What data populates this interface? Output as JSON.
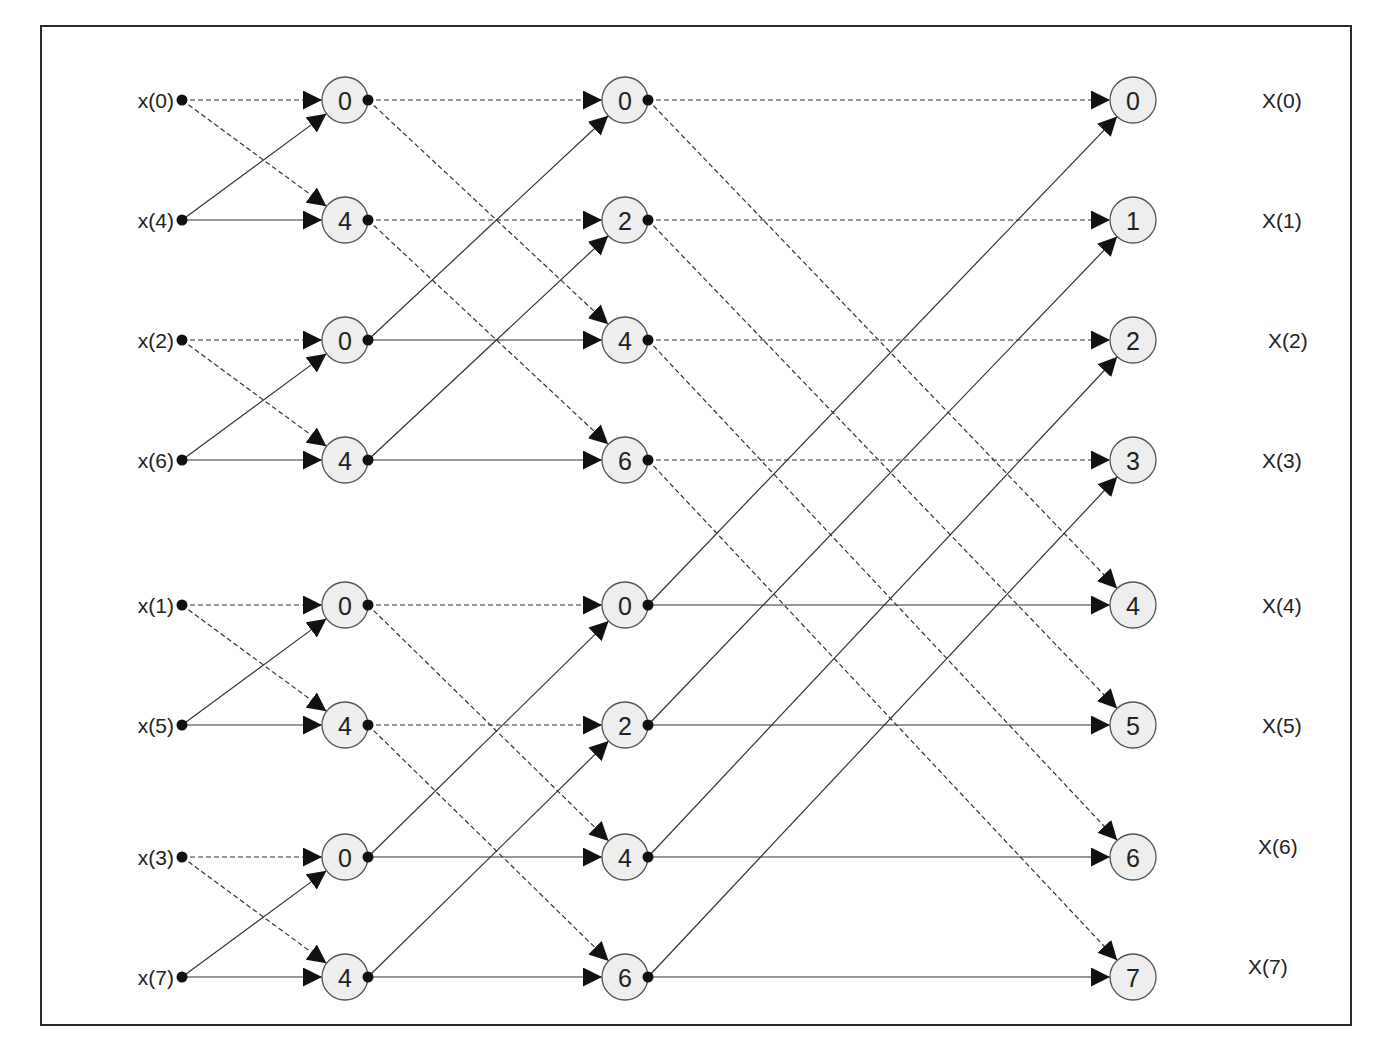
{
  "diagram": {
    "colors": {
      "node_fill": "#eeeeee",
      "node_stroke": "#555555",
      "line": "#333333",
      "border": "#2a2a2a"
    },
    "inputs": [
      {
        "label": "x(0)",
        "y": 100
      },
      {
        "label": "x(4)",
        "y": 220
      },
      {
        "label": "x(2)",
        "y": 340
      },
      {
        "label": "x(6)",
        "y": 460
      },
      {
        "label": "x(1)",
        "y": 605
      },
      {
        "label": "x(5)",
        "y": 725
      },
      {
        "label": "x(3)",
        "y": 857
      },
      {
        "label": "x(7)",
        "y": 977
      }
    ],
    "stage1": [
      "0",
      "4",
      "0",
      "4",
      "0",
      "4",
      "0",
      "4"
    ],
    "stage2": [
      "0",
      "2",
      "4",
      "6",
      "0",
      "2",
      "4",
      "6"
    ],
    "stage3": [
      "0",
      "1",
      "2",
      "3",
      "4",
      "5",
      "6",
      "7"
    ],
    "outputs": [
      {
        "label": "X(0)",
        "x": 1262,
        "y": 100
      },
      {
        "label": "X(1)",
        "x": 1262,
        "y": 220
      },
      {
        "label": "X(2)",
        "x": 1268,
        "y": 340
      },
      {
        "label": "X(3)",
        "x": 1262,
        "y": 460
      },
      {
        "label": "X(4)",
        "x": 1262,
        "y": 605
      },
      {
        "label": "X(5)",
        "x": 1262,
        "y": 725
      },
      {
        "label": "X(6)",
        "x": 1258,
        "y": 846
      },
      {
        "label": "X(7)",
        "x": 1248,
        "y": 966
      }
    ],
    "legend": {
      "dashed": "upper (sum) branch",
      "solid": "lower (twiddle-weighted) branch"
    }
  }
}
